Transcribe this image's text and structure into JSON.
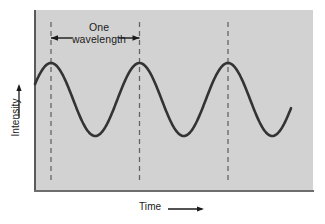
{
  "figure": {
    "name": "wave-diagram",
    "background_color": "#ffffff",
    "plot_background_color": "#d2d2d2"
  },
  "annotation": {
    "line1": "One",
    "line2": "wavelength",
    "arrow_left_name": "left-arrow-icon",
    "arrow_right_name": "right-arrow-icon"
  },
  "axes": {
    "y_label": "Intensity",
    "x_label": "Time",
    "y_arrow_name": "up-arrow-icon",
    "x_arrow_name": "right-arrow-icon"
  },
  "chart_data": {
    "type": "line",
    "title": "",
    "xlabel": "Time",
    "ylabel": "Intensity",
    "grid": false,
    "legend": false,
    "curve_color": "#333333",
    "marker_color": "#555555",
    "xlim": [
      0,
      278
    ],
    "ylim": [
      0,
      180
    ],
    "wave": {
      "amplitude_px": 36.5,
      "wavelength_px": 88.5,
      "peak_y_px": 63,
      "trough_y_px": 136,
      "midline_y_px": 99.5,
      "first_peak_x_px": 51,
      "start_x_px": 35,
      "end_x_px": 291
    },
    "markers": [
      {
        "label": "crest-1",
        "x_px": 51
      },
      {
        "label": "crest-2",
        "x_px": 139.5
      },
      {
        "label": "crest-3",
        "x_px": 228
      }
    ],
    "series": [
      {
        "name": "wave",
        "x": [
          0,
          11,
          22,
          33,
          44,
          55,
          66,
          77,
          88,
          99,
          110,
          121,
          132,
          143,
          154,
          165,
          176,
          187,
          198,
          209,
          220,
          231,
          242,
          253,
          256
        ],
        "y": [
          78.0,
          67.6,
          63.0,
          65.4,
          74.2,
          87.2,
          111.8,
          124.8,
          133.6,
          136.0,
          131.4,
          121.0,
          106.5,
          92.0,
          77.5,
          67.1,
          63.0,
          65.4,
          74.2,
          87.2,
          111.8,
          124.8,
          133.6,
          136.0,
          131.4
        ]
      }
    ]
  }
}
